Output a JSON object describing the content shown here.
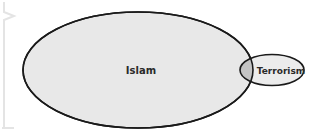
{
  "diagram": {
    "type": "venn",
    "sets": [
      {
        "id": "islam",
        "label": "Islam",
        "size": "large",
        "fill": "#e8e8e8",
        "stroke": "#1a1a1a"
      },
      {
        "id": "terrorism",
        "label": "Terrorism",
        "size": "small",
        "fill": "#ececec",
        "stroke": "#1a1a1a"
      }
    ],
    "overlap": {
      "sets": [
        "islam",
        "terrorism"
      ],
      "fill": "#c4c4c4",
      "size": "tiny"
    },
    "colors": {
      "background": "#ffffff",
      "decor_bracket": "#e6e6e6"
    }
  }
}
